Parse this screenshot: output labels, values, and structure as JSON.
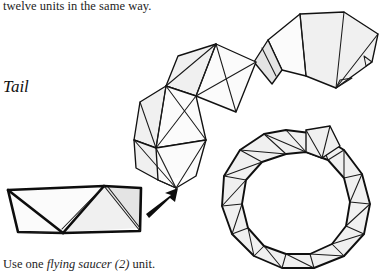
{
  "page": {
    "background_color": "#ffffff",
    "ink_color": "#111111",
    "width": 384,
    "height": 275
  },
  "text": {
    "continuation": "twelve units in the same way.",
    "section_heading": "Tail",
    "caption_prefix": "Use one ",
    "caption_emphasis": "flying saucer (2)",
    "caption_suffix": " unit."
  },
  "figures": {
    "unit_diagram": {
      "name": "flying-saucer-unit",
      "description": "folded paper module shown as a flat parallelogram with a central triangular flap"
    },
    "chain_assembly": {
      "name": "tail-chain-assembly",
      "description": "curving chain of joined triangular modules forming the tail"
    },
    "ring_assembly": {
      "name": "tail-ring-assembly",
      "description": "closed ring of triangular modules with an opening at the top right"
    },
    "assembly_arrow": {
      "name": "assembly-arrow",
      "direction": "up-right"
    }
  }
}
